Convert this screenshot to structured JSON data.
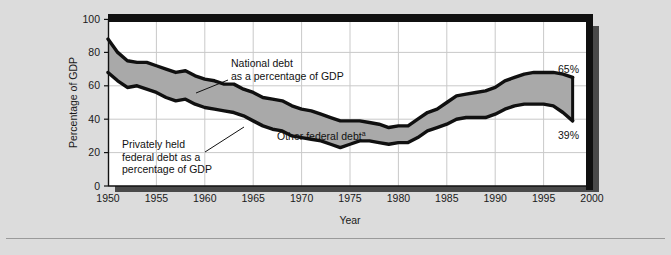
{
  "chart_data": {
    "type": "area",
    "title": "",
    "xlabel": "Year",
    "ylabel": "Percentage of GDP",
    "xlim": [
      1950,
      2000
    ],
    "ylim": [
      0,
      100
    ],
    "grid": true,
    "legend_position": "inline-annotations",
    "x_ticks": [
      "1950",
      "1955",
      "1960",
      "1965",
      "1970",
      "1975",
      "1980",
      "1985",
      "1990",
      "1995",
      "2000"
    ],
    "y_ticks": [
      "0",
      "20",
      "40",
      "60",
      "80",
      "100"
    ],
    "x": [
      1950,
      1951,
      1952,
      1953,
      1954,
      1955,
      1956,
      1957,
      1958,
      1959,
      1960,
      1961,
      1962,
      1963,
      1964,
      1965,
      1966,
      1967,
      1968,
      1969,
      1970,
      1971,
      1972,
      1973,
      1974,
      1975,
      1976,
      1977,
      1978,
      1979,
      1980,
      1981,
      1982,
      1983,
      1984,
      1985,
      1986,
      1987,
      1988,
      1989,
      1990,
      1991,
      1992,
      1993,
      1994,
      1995,
      1996,
      1997,
      1998
    ],
    "series": [
      {
        "name": "National debt as a percentage of GDP",
        "values": [
          88,
          80,
          75,
          74,
          74,
          72,
          70,
          68,
          69,
          66,
          64,
          63,
          61,
          61,
          58,
          56,
          53,
          52,
          51,
          48,
          46,
          45,
          43,
          41,
          39,
          39,
          39,
          38,
          37,
          35,
          36,
          36,
          40,
          44,
          46,
          50,
          54,
          55,
          56,
          57,
          59,
          63,
          65,
          67,
          68,
          68,
          68,
          67,
          65
        ]
      },
      {
        "name": "Privately held federal debt as a percentage of GDP",
        "values": [
          68,
          63,
          59,
          60,
          58,
          56,
          53,
          51,
          52,
          49,
          47,
          46,
          45,
          44,
          42,
          39,
          36,
          34,
          33,
          30,
          29,
          28,
          27,
          25,
          23,
          25,
          27,
          27,
          26,
          25,
          26,
          26,
          29,
          33,
          35,
          37,
          40,
          41,
          41,
          41,
          43,
          46,
          48,
          49,
          49,
          49,
          48,
          44,
          39
        ]
      }
    ],
    "annotations": [
      {
        "name": "national-debt-label",
        "text_lines": [
          "National debt",
          "as a percentage of GDP"
        ]
      },
      {
        "name": "privately-held-label",
        "text_lines": [
          "Privately held",
          "federal debt as a",
          "percentage of GDP"
        ]
      },
      {
        "name": "other-federal-debt-label",
        "text": "Other federal debt",
        "superscript": "a"
      }
    ],
    "endpoint_labels": [
      {
        "name": "national-debt-endpoint",
        "value": "65%"
      },
      {
        "name": "privately-held-endpoint",
        "value": "39%"
      }
    ],
    "colors": {
      "band_fill": "#a9a9a9",
      "line": "#101010",
      "plot_background": "#ffffff",
      "figure_background": "#dcdcdc",
      "gridline": "#c8c8c8",
      "shadow": "#3a3a3a"
    }
  },
  "labels": {
    "ylabel": "Percentage of GDP",
    "xlabel": "Year"
  },
  "annotations": {
    "national_debt_line1": "National debt",
    "national_debt_line2": "as a percentage of GDP",
    "privately_held_line1": "Privately held",
    "privately_held_line2": "federal debt as a",
    "privately_held_line3": "percentage of GDP",
    "other_federal_debt": "Other federal debt",
    "other_federal_debt_sup": "a"
  },
  "endpoints": {
    "national_debt": "65%",
    "privately_held": "39%"
  }
}
